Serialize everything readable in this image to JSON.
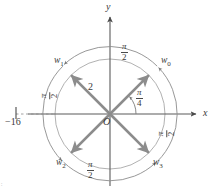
{
  "figure": {
    "axes": {
      "x_label": "x",
      "y_label": "y",
      "origin_label": "O"
    },
    "tick": {
      "label": "−16"
    },
    "radius_label": "2",
    "angles": {
      "initial": {
        "num": "π",
        "den": "4"
      },
      "step_top": {
        "num": "π",
        "den": "2"
      },
      "step_left": {
        "num": "π",
        "den": "2"
      },
      "step_right": {
        "num": "π",
        "den": "2"
      },
      "step_bottom": {
        "num": "π",
        "den": "2"
      }
    },
    "vectors": [
      {
        "name": "w",
        "index": "0",
        "angle_deg": 45
      },
      {
        "name": "w",
        "index": "1",
        "angle_deg": 135
      },
      {
        "name": "w",
        "index": "2",
        "angle_deg": 225
      },
      {
        "name": "w",
        "index": "3",
        "angle_deg": 315
      }
    ],
    "colors": {
      "vector": "#8c8c8c",
      "axis": "#5a5a5a",
      "circle": "#a0a0a0",
      "arc": "#909090",
      "text": "#3a3a3a",
      "background": "#ffffff"
    },
    "corner_mark": "∶"
  }
}
